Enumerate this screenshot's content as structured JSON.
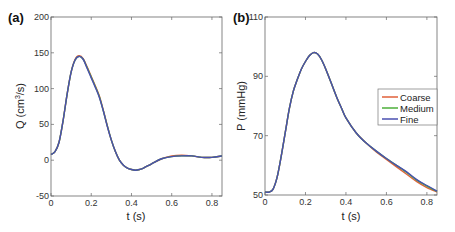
{
  "chart_data": [
    {
      "type": "line",
      "panel_label": "(a)",
      "xlabel": "t (s)",
      "ylabel": "Q (cm3/s)",
      "ylabel_base": "Q (cm",
      "ylabel_sup": "3",
      "ylabel_tail": "/s)",
      "xlim": [
        0,
        0.85
      ],
      "ylim": [
        -50,
        200
      ],
      "xticks": [
        0,
        0.2,
        0.4,
        0.6,
        0.8
      ],
      "xtick_labels": [
        "0",
        "0.2",
        "0.4",
        "0.6",
        "0.8"
      ],
      "yticks": [
        -50,
        0,
        50,
        100,
        150,
        200
      ],
      "ytick_labels": [
        "-50",
        "0",
        "50",
        "100",
        "150",
        "200"
      ],
      "grid": false,
      "x": [
        0,
        0.02,
        0.04,
        0.06,
        0.08,
        0.1,
        0.12,
        0.14,
        0.16,
        0.18,
        0.2,
        0.22,
        0.24,
        0.26,
        0.28,
        0.3,
        0.32,
        0.34,
        0.36,
        0.38,
        0.4,
        0.42,
        0.44,
        0.46,
        0.5,
        0.55,
        0.6,
        0.65,
        0.7,
        0.75,
        0.8,
        0.85
      ],
      "series": [
        {
          "name": "Coarse",
          "color": "#e0603a",
          "values": [
            8,
            12,
            25,
            55,
            92,
            123,
            141,
            146,
            142,
            130,
            117,
            104,
            90,
            70,
            48,
            28,
            12,
            0,
            -7,
            -11,
            -13,
            -14,
            -13,
            -11,
            -5,
            2,
            6,
            7,
            6,
            4,
            4,
            6
          ]
        },
        {
          "name": "Medium",
          "color": "#4caf3a",
          "values": [
            8,
            12,
            25,
            55,
            92,
            123,
            140,
            145,
            141,
            129,
            116,
            103,
            89,
            69,
            48,
            28,
            12,
            0,
            -7,
            -11,
            -13,
            -14,
            -13,
            -11,
            -5,
            2,
            5,
            6,
            6,
            4,
            4,
            6
          ]
        },
        {
          "name": "Fine",
          "color": "#4a4fb0",
          "values": [
            8,
            12,
            25,
            55,
            92,
            123,
            140,
            145,
            141,
            128,
            115,
            102,
            88,
            69,
            47,
            28,
            12,
            0,
            -7,
            -11,
            -13,
            -14,
            -13,
            -11,
            -5,
            2,
            5,
            6,
            6,
            4,
            4,
            6
          ]
        }
      ]
    },
    {
      "type": "line",
      "panel_label": "(b)",
      "xlabel": "t (s)",
      "ylabel": "P (mmHg)",
      "xlim": [
        0,
        0.85
      ],
      "ylim": [
        50,
        110
      ],
      "xticks": [
        0,
        0.2,
        0.4,
        0.6,
        0.8
      ],
      "xtick_labels": [
        "0",
        "0.2",
        "0.4",
        "0.6",
        "0.8"
      ],
      "yticks": [
        50,
        70,
        90,
        110
      ],
      "ytick_labels": [
        "50",
        "70",
        "90",
        "110"
      ],
      "grid": false,
      "legend": {
        "position": "right-center",
        "entries": [
          "Coarse",
          "Medium",
          "Fine"
        ]
      },
      "x": [
        0,
        0.02,
        0.04,
        0.06,
        0.08,
        0.1,
        0.12,
        0.14,
        0.16,
        0.18,
        0.2,
        0.22,
        0.24,
        0.26,
        0.28,
        0.3,
        0.32,
        0.34,
        0.36,
        0.38,
        0.4,
        0.45,
        0.5,
        0.55,
        0.6,
        0.65,
        0.7,
        0.75,
        0.8,
        0.85
      ],
      "series": [
        {
          "name": "Coarse",
          "color": "#e0603a",
          "values": [
            51,
            51,
            52,
            56,
            63,
            71,
            79,
            85,
            89,
            92.5,
            95,
            97,
            98,
            97.5,
            95.5,
            92.5,
            89,
            85.5,
            82,
            79,
            76,
            71,
            67.5,
            64.5,
            62,
            59.5,
            57,
            54.5,
            52.5,
            51
          ]
        },
        {
          "name": "Medium",
          "color": "#4caf3a",
          "values": [
            51,
            51,
            52,
            56,
            63,
            71,
            79,
            85,
            89,
            92.5,
            95,
            97,
            98,
            97.5,
            95.5,
            92.5,
            89,
            85.5,
            82,
            79,
            76,
            71,
            67.5,
            64.8,
            62.3,
            60,
            57.6,
            55,
            53,
            51.2
          ]
        },
        {
          "name": "Fine",
          "color": "#4a4fb0",
          "values": [
            51,
            51,
            52,
            56,
            63,
            71,
            79,
            85,
            89,
            92.5,
            95,
            97,
            98,
            97.5,
            95.5,
            92.5,
            89,
            85.5,
            82,
            79,
            76,
            71,
            67.5,
            64.8,
            62.3,
            60,
            57.8,
            55.2,
            53.2,
            51.3
          ]
        }
      ]
    }
  ]
}
